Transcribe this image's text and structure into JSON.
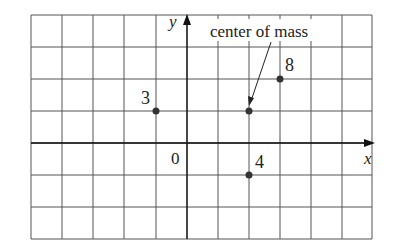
{
  "diagram": {
    "grid": {
      "x_lines": [
        31,
        62,
        93,
        124,
        156,
        187,
        218,
        249,
        280,
        311,
        342,
        372
      ],
      "y_lines": [
        15,
        47,
        79,
        111,
        143,
        175,
        207,
        239
      ],
      "color": "#555555"
    },
    "axes": {
      "x_label": "x",
      "y_label": "y",
      "origin_label": "0"
    },
    "points": [
      {
        "label": "3",
        "x": -1,
        "y": 1,
        "px": 156,
        "py": 111
      },
      {
        "label": "8",
        "x": 3,
        "y": 2,
        "px": 280,
        "py": 79
      },
      {
        "label": "4",
        "x": 2,
        "y": -1,
        "px": 249,
        "py": 175
      }
    ],
    "center_of_mass": {
      "label": "center of mass",
      "x": 2,
      "y": 1,
      "px": 249,
      "py": 111
    },
    "point_color": "#333333"
  }
}
